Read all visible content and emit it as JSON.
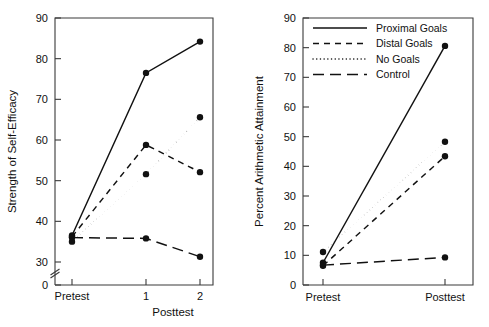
{
  "figure": {
    "background": "#ffffff",
    "ink_color": "#111111",
    "axis_color": "#3a3a3a"
  },
  "legend": {
    "position": "top-right-of-right-panel",
    "entries": [
      {
        "label": "Proximal Goals",
        "style": "solid"
      },
      {
        "label": "Distal Goals",
        "style": "dashed"
      },
      {
        "label": "No Goals",
        "style": "dotted"
      },
      {
        "label": "Control",
        "style": "longdash"
      }
    ]
  },
  "chart_data": [
    {
      "id": "left",
      "type": "line",
      "title": "",
      "xlabel": "Posttest",
      "ylabel": "Strength of Self-Efficacy",
      "categories": [
        "Pretest",
        "1",
        "2"
      ],
      "tick_labels_x": [
        "Pretest",
        "1",
        "2"
      ],
      "ylim": [
        30,
        90
      ],
      "yticks": [
        30,
        40,
        50,
        60,
        70,
        80,
        90
      ],
      "y_origin_label": "0",
      "axis_break": true,
      "grid": false,
      "series": [
        {
          "name": "Proximal Goals",
          "style": "solid",
          "values": [
            36.5,
            76.5,
            84.2
          ]
        },
        {
          "name": "Distal Goals",
          "style": "dashed",
          "values": [
            36.2,
            58.8,
            52.1
          ]
        },
        {
          "name": "No Goals",
          "style": "dotted",
          "values": [
            35.0,
            51.6,
            65.6
          ]
        },
        {
          "name": "Control",
          "style": "longdash",
          "values": [
            36.0,
            35.8,
            31.3
          ]
        }
      ]
    },
    {
      "id": "right",
      "type": "line",
      "title": "",
      "xlabel": "",
      "ylabel": "Percent Arithmetic Attainment",
      "categories": [
        "Pretest",
        "Posttest"
      ],
      "tick_labels_x": [
        "Pretest",
        "Posttest"
      ],
      "ylim": [
        0,
        90
      ],
      "yticks": [
        0,
        10,
        20,
        30,
        40,
        50,
        60,
        70,
        80,
        90
      ],
      "axis_break": false,
      "grid": false,
      "series": [
        {
          "name": "Proximal Goals",
          "style": "solid",
          "values": [
            7.5,
            80.6
          ]
        },
        {
          "name": "Distal Goals",
          "style": "dashed",
          "values": [
            6.5,
            43.4
          ]
        },
        {
          "name": "No Goals",
          "style": "dotted",
          "values": [
            11.1,
            48.3
          ]
        },
        {
          "name": "Control",
          "style": "longdash",
          "values": [
            6.7,
            9.3
          ]
        }
      ]
    }
  ]
}
